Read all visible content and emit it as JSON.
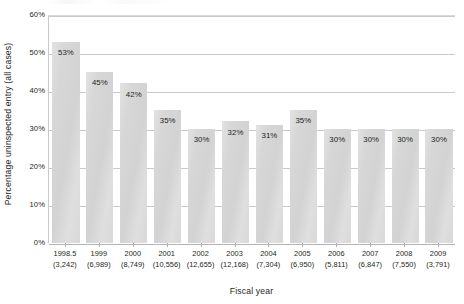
{
  "chart_data": {
    "type": "bar",
    "title": "",
    "subtitle": "",
    "xlabel": "Fiscal year",
    "ylabel": "Percentage uninspected entry (all cases)",
    "ylim": [
      0,
      60
    ],
    "yticks": [
      "0%",
      "10%",
      "20%",
      "30%",
      "40%",
      "50%",
      "60%"
    ],
    "ytick_values": [
      0,
      10,
      20,
      30,
      40,
      50,
      60
    ],
    "grid": "horizontal",
    "legend": "none",
    "categories": [
      "1998.5",
      "1999",
      "2000",
      "2001",
      "2002",
      "2003",
      "2004",
      "2005",
      "2006",
      "2007",
      "2008",
      "2009"
    ],
    "category_counts": [
      "(3,242)",
      "(6,989)",
      "(8,749)",
      "(10,556)",
      "(12,655)",
      "(12,168)",
      "(7,304)",
      "(6,950)",
      "(5,811)",
      "(6,847)",
      "(7,550)",
      "(3,791)"
    ],
    "values": [
      53,
      45,
      42,
      35,
      30,
      32,
      31,
      35,
      30,
      30,
      30,
      30
    ],
    "data_labels": [
      "53%",
      "45%",
      "42%",
      "35%",
      "30%",
      "32%",
      "31%",
      "35%",
      "30%",
      "30%",
      "30%",
      "30%"
    ],
    "bars": [
      {
        "category": "1998.5",
        "count": "(3,242)",
        "value": 53,
        "label": "53%"
      },
      {
        "category": "1999",
        "count": "(6,989)",
        "value": 45,
        "label": "45%"
      },
      {
        "category": "2000",
        "count": "(8,749)",
        "value": 42,
        "label": "42%"
      },
      {
        "category": "2001",
        "count": "(10,556)",
        "value": 35,
        "label": "35%"
      },
      {
        "category": "2002",
        "count": "(12,655)",
        "value": 30,
        "label": "30%"
      },
      {
        "category": "2003",
        "count": "(12,168)",
        "value": 32,
        "label": "32%"
      },
      {
        "category": "2004",
        "count": "(7,304)",
        "value": 31,
        "label": "31%"
      },
      {
        "category": "2005",
        "count": "(6,950)",
        "value": 35,
        "label": "35%"
      },
      {
        "category": "2006",
        "count": "(5,811)",
        "value": 30,
        "label": "30%"
      },
      {
        "category": "2007",
        "count": "(6,847)",
        "value": 30,
        "label": "30%"
      },
      {
        "category": "2008",
        "count": "(7,550)",
        "value": 30,
        "label": "30%"
      },
      {
        "category": "2009",
        "count": "(3,791)",
        "value": 30,
        "label": "30%"
      }
    ],
    "colors": {
      "bar_fill": "#d6d6d6",
      "gridline": "#c9c9c9",
      "axis": "#b0b0b0",
      "text": "#231f20",
      "background": "#ffffff"
    }
  }
}
